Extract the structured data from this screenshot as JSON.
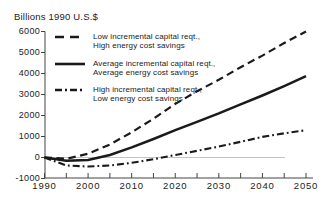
{
  "title": "Billions 1990 U.S.$",
  "chart_data": {
    "type": "line",
    "title": "Billions 1990 U.S.$",
    "xlabel": "",
    "ylabel": "Billions 1990 U.S.$",
    "xlim": [
      1990,
      2050
    ],
    "ylim": [
      -1000,
      6000
    ],
    "grid": false,
    "zero_line": true,
    "legend_position": "top-left-inside",
    "x": [
      1990,
      1995,
      2000,
      2005,
      2010,
      2015,
      2020,
      2025,
      2030,
      2035,
      2040,
      2045,
      2050
    ],
    "x_tick_labels": [
      1990,
      2000,
      2010,
      2020,
      2030,
      2040,
      2050
    ],
    "x_minor_ticks": [
      1995,
      2005,
      2015,
      2025,
      2035,
      2045
    ],
    "y_ticks": [
      -1000,
      0,
      1000,
      2000,
      3000,
      4000,
      5000,
      6000
    ],
    "series": [
      {
        "name": "Low incremental capital reqt., High energy cost savings",
        "label_line1": "Low incremental capital reqt.,",
        "label_line2": "High energy cost savings",
        "style": "dashed",
        "values": [
          0,
          -60,
          180,
          620,
          1200,
          1850,
          2550,
          3150,
          3700,
          4300,
          4850,
          5450,
          6000
        ]
      },
      {
        "name": "Average incremental capital reqt., Average energy cost savings",
        "label_line1": "Average incremental capital reqt.,",
        "label_line2": "Average energy cost savings",
        "style": "solid",
        "values": [
          0,
          -150,
          -120,
          120,
          480,
          880,
          1300,
          1700,
          2100,
          2530,
          2950,
          3400,
          3870
        ]
      },
      {
        "name": "High incremental capital reqt., Low energy cost savings",
        "label_line1": "High incremental capital reqt.,",
        "label_line2": "Low energy cost savings",
        "style": "dashdot",
        "values": [
          0,
          -380,
          -430,
          -380,
          -250,
          -80,
          120,
          320,
          520,
          750,
          980,
          1150,
          1300
        ]
      }
    ],
    "colors": {
      "line": "#1a1a1a",
      "zero_line": "#c4c4c4",
      "axis": "#444444",
      "text": "#222222"
    }
  }
}
